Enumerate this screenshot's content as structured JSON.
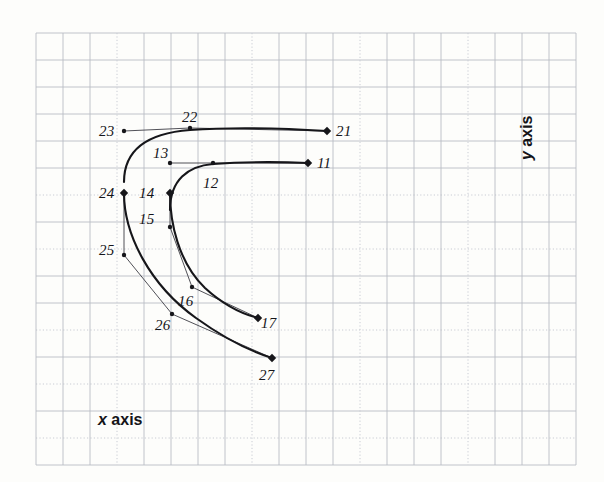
{
  "figure": {
    "background_color": "#fdfdfb",
    "grid": {
      "minor_color": "#b9bcc4",
      "dotted_color": "#c9ccd4",
      "spacing_px": 27,
      "origin_x": 36,
      "origin_y": 33,
      "cols": 20,
      "rows": 16,
      "dotted_rows": [
        6,
        8,
        11,
        13,
        15
      ],
      "dotted_cols": [
        3,
        8,
        12,
        16
      ]
    },
    "axes": {
      "x_label_prefix": "x",
      "x_label_suffix": " axis",
      "y_label_prefix": "y",
      "y_label_suffix": " axis"
    },
    "curve_color": "#16161a",
    "polygon_color": "#3c3c44"
  },
  "chart_data": {
    "type": "line",
    "title": "",
    "xlabel": "x axis",
    "ylabel": "y axis",
    "grid": true,
    "legend": null,
    "series": [
      {
        "name": "upper-curve",
        "endpoint_labels": [
          "23",
          "21"
        ],
        "control_points": [
          {
            "label": "23",
            "x": 124,
            "y": 131,
            "marker": "dot"
          },
          {
            "label": "22",
            "x": 190,
            "y": 128,
            "marker": "dot"
          },
          {
            "label": "21",
            "x": 327,
            "y": 131,
            "marker": "diamond"
          }
        ],
        "curve_path": "M124,182 C124,148 150,133 190,130 C245,126 295,129 327,131"
      },
      {
        "name": "lower-curve",
        "endpoint_labels": [
          "13",
          "11"
        ],
        "control_points": [
          {
            "label": "13",
            "x": 170,
            "y": 163,
            "marker": "dot"
          },
          {
            "label": "12",
            "x": 213,
            "y": 163,
            "marker": "dot"
          },
          {
            "label": "11",
            "x": 308,
            "y": 163,
            "marker": "diamond"
          }
        ],
        "curve_path": "M170,210 C170,180 188,166 213,164 C255,161 285,162 308,163"
      },
      {
        "name": "outer-descending-curve",
        "endpoint_labels": [
          "24",
          "27"
        ],
        "control_points": [
          {
            "label": "24",
            "x": 124,
            "y": 193,
            "marker": "diamond"
          },
          {
            "label": "25",
            "x": 124,
            "y": 255,
            "marker": "dot"
          },
          {
            "label": "26",
            "x": 172,
            "y": 314,
            "marker": "dot"
          },
          {
            "label": "27",
            "x": 272,
            "y": 358,
            "marker": "diamond"
          }
        ],
        "curve_path": "M124,193 C124,235 150,285 196,318 C228,341 256,353 272,358",
        "polygon_path": "M124,193 L124,255 L172,314 L272,358"
      },
      {
        "name": "inner-descending-curve",
        "endpoint_labels": [
          "14",
          "17"
        ],
        "control_points": [
          {
            "label": "14",
            "x": 170,
            "y": 193,
            "marker": "diamond"
          },
          {
            "label": "15",
            "x": 170,
            "y": 227,
            "marker": "dot"
          },
          {
            "label": "16",
            "x": 192,
            "y": 287,
            "marker": "dot"
          },
          {
            "label": "17",
            "x": 258,
            "y": 318,
            "marker": "diamond"
          }
        ],
        "curve_path": "M170,193 C170,222 178,262 205,288 C228,309 246,315 258,318",
        "polygon_path": "M170,193 L170,227 L192,287 L258,318"
      }
    ],
    "point_labels": [
      {
        "id": "23",
        "text": "23",
        "x": 99,
        "y": 124
      },
      {
        "id": "22",
        "text": "22",
        "x": 182,
        "y": 110
      },
      {
        "id": "21",
        "text": "21",
        "x": 336,
        "y": 124
      },
      {
        "id": "13",
        "text": "13",
        "x": 153,
        "y": 146
      },
      {
        "id": "12",
        "text": "12",
        "x": 203,
        "y": 176
      },
      {
        "id": "11",
        "text": "11",
        "x": 317,
        "y": 156
      },
      {
        "id": "24",
        "text": "24",
        "x": 99,
        "y": 186
      },
      {
        "id": "14",
        "text": "14",
        "x": 139,
        "y": 186
      },
      {
        "id": "15",
        "text": "15",
        "x": 139,
        "y": 212
      },
      {
        "id": "25",
        "text": "25",
        "x": 99,
        "y": 243
      },
      {
        "id": "16",
        "text": "16",
        "x": 178,
        "y": 294
      },
      {
        "id": "26",
        "text": "26",
        "x": 155,
        "y": 318
      },
      {
        "id": "17",
        "text": "17",
        "x": 261,
        "y": 316
      },
      {
        "id": "27",
        "text": "27",
        "x": 259,
        "y": 368
      }
    ]
  }
}
